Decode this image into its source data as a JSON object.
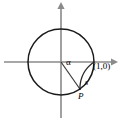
{
  "figure": {
    "type": "unit-circle-diagram",
    "background_color": "#ffffff"
  },
  "colors": {
    "axis": "#8a8a8a",
    "circle": "#1a1a1a",
    "radius": "#3a3a3a",
    "arc": "#2a2a2a",
    "text": "#000000"
  },
  "geometry": {
    "origin": {
      "x": 61,
      "y": 62
    },
    "radius_px": 33,
    "circle_bbox": {
      "left": 28,
      "top": 29,
      "right": 94,
      "bottom": 95
    },
    "x_axis": {
      "x1": 4,
      "y1": 62,
      "x2": 114,
      "y2": 62,
      "arrow": "right"
    },
    "y_axis": {
      "x1": 61,
      "y1": 116,
      "x2": 61,
      "y2": 6,
      "arrow": "up"
    },
    "point_P": {
      "x": 79,
      "y": 90
    },
    "angle_alpha_degrees": -55,
    "arc_start_degrees": 0,
    "arc_end_degrees": -55,
    "arc_direction": "clockwise"
  },
  "labels": {
    "alpha": "α",
    "point_value": "(1,0)",
    "arc": "s",
    "point_name": "P"
  }
}
